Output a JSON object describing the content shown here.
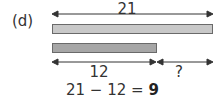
{
  "diagram": {
    "part_label": "(d)",
    "total": {
      "label": "21",
      "value": 21
    },
    "bars": [
      {
        "name": "total-bar",
        "value": 21,
        "color": "#c8c8c8"
      },
      {
        "name": "known-part-bar",
        "value": 12,
        "color": "#a6a6a6"
      }
    ],
    "segments": [
      {
        "label": "12",
        "value": 12
      },
      {
        "label": "?",
        "value": null
      }
    ],
    "equation": {
      "expression": "21 − 12 = ",
      "answer": "9"
    }
  }
}
